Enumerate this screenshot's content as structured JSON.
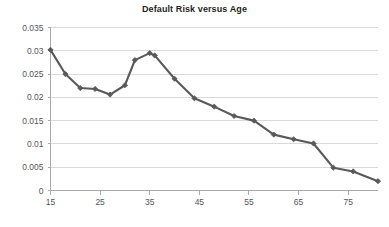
{
  "chart_data": {
    "type": "line",
    "title": "Default Risk versus Age",
    "xlabel": "",
    "ylabel": "",
    "xlim": [
      15,
      81
    ],
    "ylim": [
      0,
      0.035
    ],
    "grid": true,
    "legend": "none",
    "line_color": "#595959",
    "marker": "diamond",
    "marker_color": "#595959",
    "gridline_color": "#d9d9d9",
    "axis_color": "#aaaaaa",
    "x_ticks": [
      15,
      25,
      35,
      45,
      55,
      65,
      75
    ],
    "x_tick_labels": [
      "15",
      "25",
      "35",
      "45",
      "55",
      "65",
      "75"
    ],
    "y_ticks": [
      0,
      0.005,
      0.01,
      0.015,
      0.02,
      0.025,
      0.03,
      0.035
    ],
    "y_tick_labels": [
      "0",
      "0.005",
      "0.01",
      "0.015",
      "0.02",
      "0.025",
      "0.03",
      "0.035"
    ],
    "x": [
      15,
      18,
      21,
      24,
      27,
      30,
      33,
      36,
      39,
      42,
      45,
      48,
      51,
      54,
      57,
      60,
      63,
      66,
      69,
      72,
      75,
      78,
      81
    ],
    "values": [
      0.0302,
      0.025,
      0.022,
      0.0205,
      0.0208,
      0.028,
      0.0295,
      0.029,
      0.024,
      0.0215,
      0.0198,
      0.018,
      0.0168,
      0.016,
      0.0152,
      0.015,
      0.0136,
      0.012,
      0.0112,
      0.011,
      0.0102,
      0.0095,
      0.0049
    ],
    "series": [
      {
        "name": "Default Risk",
        "points": [
          {
            "x": 15,
            "y": 0.0302
          },
          {
            "x": 18,
            "y": 0.025
          },
          {
            "x": 21,
            "y": 0.022
          },
          {
            "x": 24,
            "y": 0.0218
          },
          {
            "x": 27,
            "y": 0.0206
          },
          {
            "x": 30,
            "y": 0.0226
          },
          {
            "x": 32,
            "y": 0.028
          },
          {
            "x": 35,
            "y": 0.0295
          },
          {
            "x": 36,
            "y": 0.029
          },
          {
            "x": 40,
            "y": 0.024
          },
          {
            "x": 44,
            "y": 0.0198
          },
          {
            "x": 48,
            "y": 0.018
          },
          {
            "x": 52,
            "y": 0.016
          },
          {
            "x": 56,
            "y": 0.015
          },
          {
            "x": 60,
            "y": 0.012
          },
          {
            "x": 64,
            "y": 0.011
          },
          {
            "x": 68,
            "y": 0.0101
          },
          {
            "x": 72,
            "y": 0.0049
          },
          {
            "x": 76,
            "y": 0.0041
          },
          {
            "x": 81,
            "y": 0.002
          }
        ]
      }
    ]
  }
}
